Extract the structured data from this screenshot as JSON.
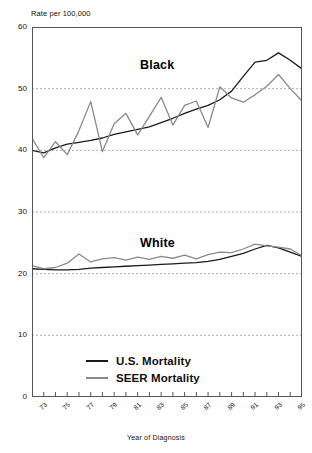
{
  "chart_data": {
    "type": "line",
    "title": "",
    "ylabel": "Rate per 100,000",
    "xlabel": "Year of Diagnosis",
    "ylim": [
      0,
      60
    ],
    "yticks": [
      0,
      10,
      20,
      30,
      40,
      50,
      60
    ],
    "grid": "horizontal-dashed",
    "legend_position": "bottom-center",
    "x": [
      1973,
      1974,
      1975,
      1976,
      1977,
      1978,
      1979,
      1980,
      1981,
      1982,
      1983,
      1984,
      1985,
      1986,
      1987,
      1988,
      1989,
      1990,
      1991,
      1992,
      1993,
      1994,
      1995,
      1996
    ],
    "xtick_labels": [
      "73",
      "75",
      "77",
      "79",
      "81",
      "83",
      "85",
      "87",
      "89",
      "91",
      "93",
      "95"
    ],
    "xtick_values": [
      1973,
      1975,
      1977,
      1979,
      1981,
      1983,
      1985,
      1987,
      1989,
      1991,
      1993,
      1995
    ],
    "annotations": [
      {
        "text": "Black",
        "x": 1983,
        "y": 53.5
      },
      {
        "text": "White",
        "x": 1983,
        "y": 26.5
      }
    ],
    "series": [
      {
        "name": "U.S. Mortality",
        "group": "Black",
        "color": "#1a1a1a",
        "values": [
          40.0,
          39.6,
          40.4,
          41.0,
          41.3,
          41.6,
          42.0,
          42.6,
          43.0,
          43.4,
          43.8,
          44.5,
          45.2,
          46.0,
          46.7,
          47.3,
          48.2,
          49.6,
          52.0,
          54.3,
          54.6,
          55.8,
          54.6,
          53.2
        ]
      },
      {
        "name": "SEER Mortality",
        "group": "Black",
        "color": "#8a8a8a",
        "values": [
          42.0,
          38.8,
          41.4,
          39.3,
          43.2,
          47.9,
          39.8,
          44.3,
          46.0,
          42.5,
          45.5,
          48.6,
          44.1,
          47.3,
          48.0,
          43.7,
          50.3,
          48.5,
          47.8,
          49.0,
          50.4,
          52.3,
          50.0,
          48.0
        ]
      },
      {
        "name": "U.S. Mortality",
        "group": "White",
        "color": "#1a1a1a",
        "values": [
          20.8,
          20.7,
          20.6,
          20.6,
          20.7,
          20.9,
          21.0,
          21.1,
          21.2,
          21.3,
          21.4,
          21.5,
          21.6,
          21.7,
          21.8,
          22.0,
          22.3,
          22.8,
          23.3,
          24.0,
          24.6,
          24.2,
          23.5,
          22.8
        ]
      },
      {
        "name": "SEER Mortality",
        "group": "White",
        "color": "#8a8a8a",
        "values": [
          21.3,
          20.8,
          21.0,
          21.7,
          23.2,
          21.9,
          22.4,
          22.6,
          22.2,
          22.7,
          22.3,
          22.8,
          22.5,
          23.0,
          22.4,
          23.1,
          23.5,
          23.4,
          24.0,
          24.8,
          24.5,
          24.3,
          24.0,
          22.9
        ]
      }
    ]
  },
  "legend": [
    {
      "label": "U.S. Mortality",
      "color": "#1a1a1a"
    },
    {
      "label": "SEER Mortality",
      "color": "#8a8a8a"
    }
  ]
}
